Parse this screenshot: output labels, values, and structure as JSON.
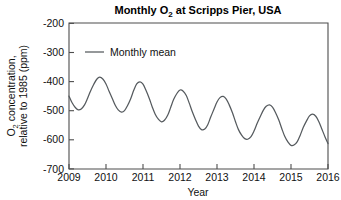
{
  "chart_data": {
    "type": "line",
    "title": "Monthly O2 at Scripps Pier, USA",
    "title_parts": {
      "pre": "Monthly O",
      "sub": "2",
      "post": " at Scripps Pier, USA"
    },
    "xlabel": "Year",
    "ylabel": "O2 concentration, relative to 1985 (ppm)",
    "ylabel_line1_parts": {
      "pre": "O",
      "sub": "2",
      "post": " concentration,"
    },
    "ylabel_line2": "relative to 1985 (ppm)",
    "xlim": [
      2009,
      2016
    ],
    "ylim": [
      -700,
      -200
    ],
    "xticks": [
      2009,
      2010,
      2011,
      2012,
      2013,
      2014,
      2015,
      2016
    ],
    "xticklabels": [
      "2009",
      "2010",
      "2011",
      "2012",
      "2013",
      "2014",
      "2015",
      "2016"
    ],
    "yticks": [
      -200,
      -300,
      -400,
      -500,
      -600,
      -700
    ],
    "yticklabels": [
      "-200",
      "-300",
      "-400",
      "-500",
      "-600",
      "-700"
    ],
    "grid": false,
    "legend": {
      "position": "upper-left-inside",
      "entries": [
        {
          "label": "Monthly mean",
          "color": "#555a5e",
          "style": "solid-line"
        }
      ]
    },
    "line_color": "#555a5e",
    "series": [
      {
        "name": "Monthly mean",
        "x": [
          2009.0,
          2009.08,
          2009.17,
          2009.25,
          2009.33,
          2009.42,
          2009.5,
          2009.58,
          2009.67,
          2009.75,
          2009.83,
          2009.92,
          2010.0,
          2010.08,
          2010.17,
          2010.25,
          2010.33,
          2010.42,
          2010.5,
          2010.58,
          2010.67,
          2010.75,
          2010.83,
          2010.92,
          2011.0,
          2011.08,
          2011.17,
          2011.25,
          2011.33,
          2011.42,
          2011.5,
          2011.58,
          2011.67,
          2011.75,
          2011.83,
          2011.92,
          2012.0,
          2012.08,
          2012.17,
          2012.25,
          2012.33,
          2012.42,
          2012.5,
          2012.58,
          2012.67,
          2012.75,
          2012.83,
          2012.92,
          2013.0,
          2013.08,
          2013.17,
          2013.25,
          2013.33,
          2013.42,
          2013.5,
          2013.58,
          2013.67,
          2013.75,
          2013.83,
          2013.92,
          2014.0,
          2014.08,
          2014.17,
          2014.25,
          2014.33,
          2014.42,
          2014.5,
          2014.58,
          2014.67,
          2014.75,
          2014.83,
          2014.92,
          2015.0,
          2015.08,
          2015.17,
          2015.25,
          2015.33,
          2015.42,
          2015.5,
          2015.58,
          2015.67,
          2015.75,
          2015.83,
          2015.92,
          2016.0
        ],
        "y": [
          -450,
          -472,
          -489,
          -497,
          -494,
          -480,
          -458,
          -433,
          -409,
          -392,
          -385,
          -392,
          -408,
          -432,
          -458,
          -481,
          -497,
          -505,
          -500,
          -483,
          -458,
          -430,
          -408,
          -401,
          -409,
          -430,
          -458,
          -487,
          -512,
          -530,
          -538,
          -533,
          -515,
          -488,
          -461,
          -440,
          -429,
          -432,
          -448,
          -474,
          -503,
          -531,
          -553,
          -565,
          -563,
          -548,
          -522,
          -494,
          -470,
          -455,
          -451,
          -460,
          -480,
          -508,
          -538,
          -565,
          -585,
          -596,
          -598,
          -589,
          -570,
          -545,
          -520,
          -499,
          -485,
          -480,
          -488,
          -506,
          -532,
          -561,
          -588,
          -608,
          -619,
          -618,
          -606,
          -584,
          -558,
          -535,
          -518,
          -512,
          -519,
          -537,
          -562,
          -590,
          -613
        ]
      }
    ],
    "annual_peaks": [
      {
        "year": 2009.83,
        "value": -385
      },
      {
        "year": 2010.83,
        "value": -401
      },
      {
        "year": 2011.92,
        "value": -429
      },
      {
        "year": 2013.17,
        "value": -451
      },
      {
        "year": 2014.42,
        "value": -480
      },
      {
        "year": 2015.58,
        "value": -512
      }
    ],
    "annual_troughs": [
      {
        "year": 2009.25,
        "value": -497
      },
      {
        "year": 2010.42,
        "value": -505
      },
      {
        "year": 2011.5,
        "value": -538
      },
      {
        "year": 2012.58,
        "value": -565
      },
      {
        "year": 2013.83,
        "value": -598
      },
      {
        "year": 2015.0,
        "value": -619
      },
      {
        "year": 2016.0,
        "value": -613
      }
    ],
    "trend": "declining approximately 25 ppm per year with strong annual seasonal cycle"
  }
}
